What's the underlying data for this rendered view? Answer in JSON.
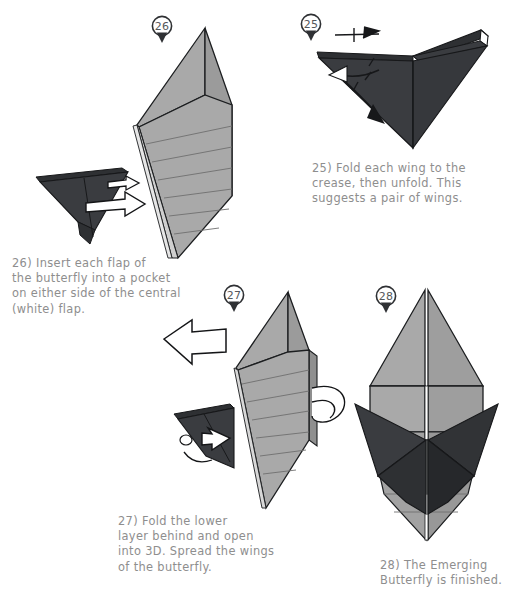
{
  "page": {
    "background": "#ffffff",
    "text_color": "#8e8e8e",
    "ink_color": "#2f3134",
    "paper_light": "#a9a9a9",
    "paper_mid": "#9a9a9a",
    "paper_dark": "#3a3c40",
    "paper_darker": "#2e3033",
    "paper_white": "#ffffff"
  },
  "steps": [
    {
      "id": "step-26",
      "number": "26",
      "caption": "26) Insert each flap of\nthe butterfly into a pocket\non either side of the central\n(white) flap.",
      "arrows": [
        "insert-arrow-upper",
        "insert-arrow-lower"
      ],
      "arrow_style": "hollow-white-push"
    },
    {
      "id": "step-25",
      "number": "25",
      "caption": "25) Fold each wing to the\ncrease, then unfold. This\nsuggests a pair of wings.",
      "arrows": [
        "fold-arrow",
        "unfold-arrow",
        "fold-and-unfold-symbol"
      ],
      "arrow_style": "solid-black-valley"
    },
    {
      "id": "step-27",
      "number": "27",
      "caption": "27) Fold the lower\nlayer behind and open\ninto 3D. Spread the wings\nof the butterfly.",
      "arrows": [
        "pull-left-arrow",
        "spread-wing-arrow",
        "open-3d-loop-arrow"
      ],
      "arrow_style": "hollow-white-push"
    },
    {
      "id": "step-28",
      "number": "28",
      "caption": "28) The Emerging\nButterfly is finished.",
      "arrows": [],
      "arrow_style": "none"
    }
  ]
}
